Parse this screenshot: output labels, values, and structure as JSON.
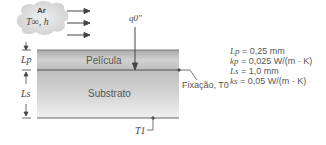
{
  "air": {
    "name": "Ar",
    "conditions": "T∞, h"
  },
  "heat_flux": {
    "symbol": "q0\""
  },
  "layers": {
    "film": {
      "label": "Película",
      "thickness_symbol": "Lp"
    },
    "substrate": {
      "label": "Substrato",
      "thickness_symbol": "Ls"
    }
  },
  "interface": {
    "label": "Fixação, T0"
  },
  "bottom": {
    "label": "T1"
  },
  "properties": [
    {
      "symbol": "Lp",
      "value": "= 0,25 mm"
    },
    {
      "symbol": "kp",
      "value": "= 0,025 W/(m · K)"
    },
    {
      "symbol": "Ls",
      "value": "= 1,0 mm"
    },
    {
      "symbol": "ks",
      "value": "= 0,05 W/(m · K)"
    }
  ],
  "colors": {
    "line": "#555555",
    "film": "#c8c8c8",
    "substrate": "#d6d6d6",
    "cloud": "#dedede"
  }
}
